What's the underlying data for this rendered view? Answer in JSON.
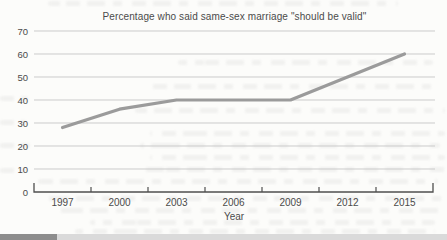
{
  "chart_data": {
    "type": "line",
    "title": "Percentage who said same-sex marriage \"should be valid\"",
    "xlabel": "Year",
    "ylabel": "",
    "x": [
      "1997",
      "2000",
      "2003",
      "2006",
      "2009",
      "2012",
      "2015"
    ],
    "values": [
      28,
      36,
      40,
      40,
      40,
      50,
      60
    ],
    "ylim": [
      0,
      70
    ],
    "yticks": [
      0,
      10,
      20,
      30,
      40,
      50,
      60,
      70
    ],
    "grid": true,
    "legend_position": "none",
    "line_color": "#9b9b9b",
    "grid_color": "#cbcbcb",
    "axis_color": "#4f4f4f",
    "text_color": "#4b4b4b"
  },
  "footer_strip": {
    "left_color": "#8d8d8d",
    "right_color": "#dadada"
  }
}
